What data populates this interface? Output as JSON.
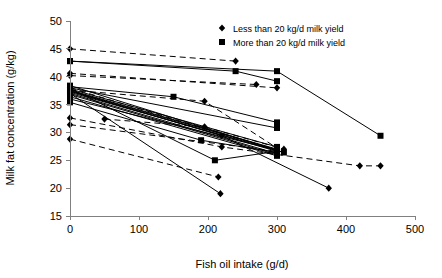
{
  "chart_data": {
    "type": "line",
    "title": "",
    "xlabel": "Fish oil intake (g/d)",
    "ylabel": "Milk fat concentration (g/kg)",
    "xlim": [
      0,
      500
    ],
    "ylim": [
      15,
      50
    ],
    "xticks": [
      0,
      100,
      200,
      300,
      400,
      500
    ],
    "yticks": [
      15,
      20,
      25,
      30,
      35,
      40,
      45,
      50
    ],
    "grid": false,
    "legend_position": "top-right",
    "legend": [
      {
        "label": "Less than 20 kg/d milk yield",
        "marker": "diamond",
        "linestyle": "dashed"
      },
      {
        "label": "More than 20 kg/d milk yield",
        "marker": "square",
        "linestyle": "solid"
      }
    ],
    "series": [
      {
        "name": "low-yield-1",
        "group": "less",
        "marker": "diamond",
        "linestyle": "dashed",
        "points": [
          [
            0,
            45.0
          ],
          [
            240,
            42.8
          ]
        ]
      },
      {
        "name": "low-yield-2",
        "group": "less",
        "marker": "diamond",
        "linestyle": "dashed",
        "points": [
          [
            0,
            40.6
          ],
          [
            300,
            38.0
          ]
        ]
      },
      {
        "name": "low-yield-3",
        "group": "less",
        "marker": "diamond",
        "linestyle": "dashed",
        "points": [
          [
            0,
            40.2
          ],
          [
            270,
            38.6
          ]
        ]
      },
      {
        "name": "low-yield-4",
        "group": "less",
        "marker": "diamond",
        "linestyle": "dashed",
        "points": [
          [
            0,
            32.6
          ],
          [
            220,
            27.4
          ],
          [
            420,
            24.0
          ],
          [
            450,
            24.0
          ]
        ]
      },
      {
        "name": "low-yield-5",
        "group": "less",
        "marker": "diamond",
        "linestyle": "dashed",
        "points": [
          [
            0,
            31.4
          ],
          [
            300,
            26.6
          ]
        ]
      },
      {
        "name": "low-yield-6",
        "group": "less",
        "marker": "diamond",
        "linestyle": "dashed",
        "points": [
          [
            0,
            28.8
          ],
          [
            215,
            22.0
          ]
        ]
      },
      {
        "name": "low-yield-7",
        "group": "less",
        "marker": "diamond",
        "linestyle": "dashed",
        "points": [
          [
            50,
            32.4
          ],
          [
            195,
            31.0
          ],
          [
            310,
            27.0
          ]
        ]
      },
      {
        "name": "low-yield-8",
        "group": "less",
        "marker": "diamond",
        "linestyle": "dashed",
        "points": [
          [
            0,
            37.6
          ],
          [
            195,
            35.6
          ],
          [
            300,
            27.2
          ]
        ]
      },
      {
        "name": "low-yield-9",
        "group": "less",
        "marker": "diamond",
        "linestyle": "dashed",
        "points": [
          [
            0,
            38.0
          ],
          [
            300,
            26.8
          ]
        ]
      },
      {
        "name": "low-yield-10",
        "group": "less",
        "marker": "diamond",
        "linestyle": "solid",
        "points": [
          [
            0,
            37.4
          ],
          [
            220,
            29.4
          ],
          [
            375,
            20.0
          ]
        ]
      },
      {
        "name": "low-yield-11",
        "group": "less",
        "marker": "diamond",
        "linestyle": "solid",
        "points": [
          [
            0,
            37.0
          ],
          [
            218,
            19.0
          ]
        ]
      },
      {
        "name": "high-yield-1",
        "group": "more",
        "marker": "square",
        "linestyle": "solid",
        "points": [
          [
            0,
            42.8
          ],
          [
            300,
            41.0
          ],
          [
            450,
            29.4
          ]
        ]
      },
      {
        "name": "high-yield-2",
        "group": "more",
        "marker": "square",
        "linestyle": "solid",
        "points": [
          [
            0,
            42.8
          ],
          [
            240,
            41.0
          ],
          [
            300,
            39.2
          ]
        ]
      },
      {
        "name": "high-yield-3",
        "group": "more",
        "marker": "square",
        "linestyle": "solid",
        "points": [
          [
            0,
            38.2
          ],
          [
            150,
            36.4
          ],
          [
            300,
            31.8
          ]
        ]
      },
      {
        "name": "high-yield-4",
        "group": "more",
        "marker": "square",
        "linestyle": "solid",
        "points": [
          [
            0,
            38.0
          ],
          [
            300,
            30.8
          ]
        ]
      },
      {
        "name": "high-yield-5",
        "group": "more",
        "marker": "square",
        "linestyle": "solid",
        "points": [
          [
            0,
            37.8
          ],
          [
            300,
            27.4
          ]
        ]
      },
      {
        "name": "high-yield-6",
        "group": "more",
        "marker": "square",
        "linestyle": "solid",
        "points": [
          [
            0,
            37.6
          ],
          [
            300,
            27.0
          ]
        ]
      },
      {
        "name": "high-yield-7",
        "group": "more",
        "marker": "square",
        "linestyle": "solid",
        "points": [
          [
            0,
            37.4
          ],
          [
            300,
            26.6
          ]
        ]
      },
      {
        "name": "high-yield-8",
        "group": "more",
        "marker": "square",
        "linestyle": "solid",
        "points": [
          [
            0,
            37.2
          ],
          [
            310,
            26.4
          ]
        ]
      },
      {
        "name": "high-yield-9",
        "group": "more",
        "marker": "square",
        "linestyle": "solid",
        "points": [
          [
            0,
            37.0
          ],
          [
            300,
            26.2
          ]
        ]
      },
      {
        "name": "high-yield-10",
        "group": "more",
        "marker": "square",
        "linestyle": "solid",
        "points": [
          [
            0,
            36.8
          ],
          [
            300,
            26.0
          ]
        ]
      },
      {
        "name": "high-yield-11",
        "group": "more",
        "marker": "square",
        "linestyle": "solid",
        "points": [
          [
            0,
            36.4
          ],
          [
            300,
            25.8
          ]
        ]
      },
      {
        "name": "high-yield-12",
        "group": "more",
        "marker": "square",
        "linestyle": "solid",
        "points": [
          [
            0,
            36.0
          ],
          [
            300,
            26.8
          ]
        ]
      },
      {
        "name": "high-yield-13",
        "group": "more",
        "marker": "square",
        "linestyle": "solid",
        "points": [
          [
            0,
            35.4
          ],
          [
            190,
            28.6
          ],
          [
            300,
            26.4
          ]
        ]
      },
      {
        "name": "high-yield-14",
        "group": "more",
        "marker": "square",
        "linestyle": "solid",
        "points": [
          [
            0,
            38.4
          ],
          [
            300,
            26.8
          ]
        ]
      },
      {
        "name": "high-yield-15",
        "group": "more",
        "marker": "square",
        "linestyle": "solid",
        "points": [
          [
            0,
            37.9
          ],
          [
            210,
            25.0
          ],
          [
            300,
            26.6
          ]
        ]
      },
      {
        "name": "high-yield-16",
        "group": "more",
        "marker": "square",
        "linestyle": "solid",
        "points": [
          [
            0,
            37.5
          ],
          [
            300,
            26.9
          ]
        ]
      }
    ]
  },
  "layout": {
    "plot_left_px": 70,
    "plot_right_px": 415,
    "plot_top_px": 21,
    "plot_bottom_px": 216
  }
}
